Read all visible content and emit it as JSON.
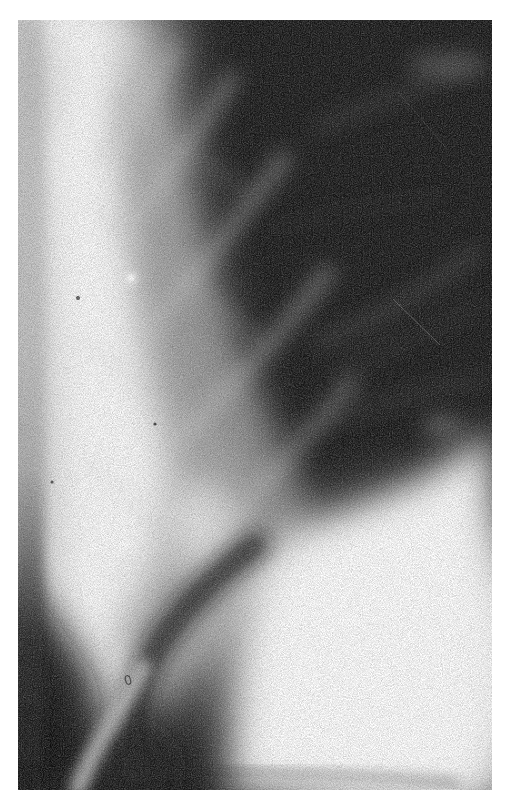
{
  "meta": {
    "content_type": "radiograph"
  },
  "figure": {
    "alt": "Chest radiograph detail: bright sternum band on the left, dark lung field with faint criss-crossing rib shadows above, and a bright diaphragm dome in the lower right, surrounded by a white paper margin",
    "regions": [
      {
        "name": "page-margin",
        "description": "White paper border around the film"
      },
      {
        "name": "sternum-band",
        "description": "Bright vertical band along the left edge of the film"
      },
      {
        "name": "lung-field",
        "description": "Dark lung field occupying the upper right"
      },
      {
        "name": "rib-shadows",
        "description": "Criss-crossing faint diagonal rib shadows in the grey mid zone"
      },
      {
        "name": "vessel-wisps",
        "description": "Soft light streaks across the dark field"
      },
      {
        "name": "diaphragm-dome",
        "description": "Large bright white dome in the lower right"
      },
      {
        "name": "converging-bands",
        "description": "Light bands narrowing to a descending stalk at the lower left"
      },
      {
        "name": "film-grain",
        "description": "Coarse photographic grain, small bright flecks and fine scratches"
      }
    ]
  },
  "palette": {
    "page_background": "#ffffff",
    "film_shadow": "#171717",
    "film_highlight": "#ffffff",
    "film_midtone": "#8e8e8e",
    "edge_gray": "#c6c6c6"
  }
}
